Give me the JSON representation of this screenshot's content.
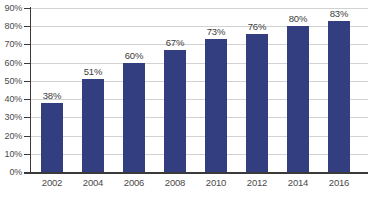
{
  "chart_data": {
    "type": "bar",
    "title": "",
    "subtitle": "",
    "xlabel": "",
    "ylabel": "",
    "categories": [
      "2002",
      "2004",
      "2006",
      "2008",
      "2010",
      "2012",
      "2014",
      "2016"
    ],
    "values": [
      38,
      51,
      60,
      67,
      73,
      76,
      80,
      83
    ],
    "value_labels": [
      "38%",
      "51%",
      "60%",
      "67%",
      "73%",
      "76%",
      "80%",
      "83%"
    ],
    "ylim": [
      0,
      90
    ],
    "ytick_values": [
      0,
      10,
      20,
      30,
      40,
      50,
      60,
      70,
      80,
      90
    ],
    "ytick_labels": [
      "0%",
      "10%",
      "20%",
      "30%",
      "40%",
      "50%",
      "60%",
      "70%",
      "80%",
      "90%"
    ],
    "grid": true,
    "grid_axis": "y",
    "legend": false,
    "legend_position": "none",
    "bar_color": "#333e80",
    "gridline_color": "#d2d2d2",
    "axis_color": "#3a3a3a",
    "background_color": "#ffffff",
    "data_label_color": "#3c3c3c",
    "tick_label_color": "#4a4a4a"
  }
}
